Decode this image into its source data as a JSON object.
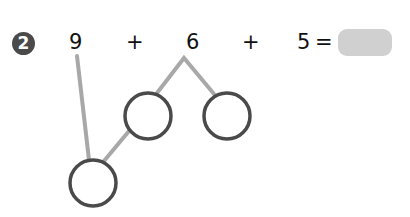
{
  "question": {
    "number": "2",
    "terms": [
      "9",
      "6",
      "5"
    ],
    "operators": [
      "+",
      "+"
    ],
    "equals": "=",
    "answer": ""
  },
  "colors": {
    "badge": "#4a4a4a",
    "answer_box": "#d0d0d0",
    "connector_line": "#a8a8a8",
    "circle_stroke": "#4a4a4a"
  },
  "number_bonds": {
    "circles": [
      {
        "cx": 148,
        "cy": 116,
        "r": 23,
        "value": ""
      },
      {
        "cx": 227,
        "cy": 116,
        "r": 23,
        "value": ""
      },
      {
        "cx": 93,
        "cy": 183,
        "r": 23,
        "value": ""
      }
    ]
  }
}
